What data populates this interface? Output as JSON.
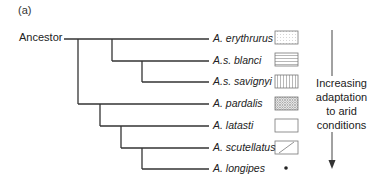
{
  "panel_label": "(a)",
  "root_label": "Ancestor",
  "taxa": [
    {
      "name": "A. erythrurus",
      "pattern": "dotted-box"
    },
    {
      "name": "A.s. blanci",
      "pattern": "horizontal-lines-box"
    },
    {
      "name": "A.s. savignyi",
      "pattern": "vertical-lines-box"
    },
    {
      "name": "A. pardalis",
      "pattern": "crosshatch-box"
    },
    {
      "name": "A. latasti",
      "pattern": "empty-box"
    },
    {
      "name": "A. scutellatus",
      "pattern": "diagonal-line-box"
    },
    {
      "name": "A. longipes",
      "pattern": "dot"
    }
  ],
  "arrow": {
    "line1": "Increasing",
    "line2": "adaptation",
    "line3": "to arid",
    "line4": "conditions",
    "direction": "down"
  },
  "colors": {
    "line": "#333333",
    "pattern": "#888888"
  }
}
